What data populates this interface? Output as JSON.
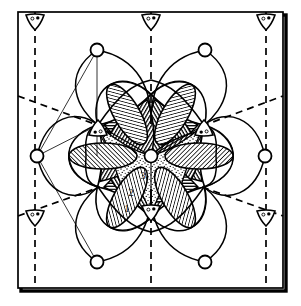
{
  "figure": {
    "name": "crystallographic-unit-cell-diagram",
    "type": "diagram",
    "background_color": "#ffffff",
    "ink_color": "#000000",
    "border": {
      "style": "solid-square-with-drop-shadow",
      "x": 18,
      "y": 12,
      "width": 265,
      "height": 276,
      "stroke_width": 1.6,
      "shadow_offset": 3
    }
  },
  "labels": [
    {
      "id": "zone-3",
      "text": "3",
      "x": 143,
      "y": 175
    },
    {
      "id": "zone-2",
      "text": "2",
      "x": 131,
      "y": 192
    },
    {
      "id": "zone-1",
      "text": "1",
      "x": 127,
      "y": 209
    }
  ],
  "symmetry": {
    "center_point": {
      "x": 151,
      "y": 156,
      "radius": 6.5,
      "symbol": "six-fold-axis-open-circle"
    },
    "triad_axes": [
      {
        "x": 151,
        "y": 217,
        "rotation": 0,
        "symbol": "three-fold-axis-triangle"
      },
      {
        "x": 98,
        "y": 125,
        "rotation": 180,
        "symbol": "three-fold-axis-triangle"
      },
      {
        "x": 204,
        "y": 125,
        "rotation": 180,
        "symbol": "three-fold-axis-triangle"
      }
    ],
    "corner_triads": [
      {
        "x": 35,
        "y": 18,
        "symbol": "three-fold-axis-triangle"
      },
      {
        "x": 151,
        "y": 18,
        "symbol": "three-fold-axis-triangle"
      },
      {
        "x": 266,
        "y": 18,
        "symbol": "three-fold-axis-triangle"
      },
      {
        "x": 35,
        "y": 216,
        "symbol": "three-fold-axis-triangle"
      },
      {
        "x": 266,
        "y": 216,
        "symbol": "three-fold-axis-triangle"
      }
    ],
    "open_circle_nodes": [
      {
        "x": 97,
        "y": 50
      },
      {
        "x": 205,
        "y": 50
      },
      {
        "x": 37,
        "y": 156
      },
      {
        "x": 265,
        "y": 156
      },
      {
        "x": 97,
        "y": 262
      },
      {
        "x": 205,
        "y": 262
      }
    ],
    "node_radius": 6.5
  },
  "dashed_lines": {
    "style": "dashed",
    "dash_pattern": "7,5",
    "vertical": [
      {
        "x": 35,
        "y1": 18,
        "y2": 288
      },
      {
        "x": 151,
        "y1": 18,
        "y2": 288
      },
      {
        "x": 266,
        "y1": 18,
        "y2": 288
      }
    ],
    "diagonal": [
      {
        "x1": 18,
        "y1": 95,
        "x2": 98,
        "y2": 125
      },
      {
        "x1": 204,
        "y1": 125,
        "x2": 283,
        "y2": 95
      },
      {
        "x1": 18,
        "y1": 216,
        "x2": 98,
        "y2": 188
      },
      {
        "x1": 204,
        "y1": 188,
        "x2": 283,
        "y2": 216
      }
    ]
  },
  "fills": {
    "central_star": "stipple",
    "inner_lobes": "horizontal-hatch",
    "outer_lenses": "diagonal-hatch",
    "petals": "none-white"
  },
  "geometry": {
    "hexagon_vertices": [
      {
        "x": 98,
        "y": 125
      },
      {
        "x": 204,
        "y": 125
      },
      {
        "x": 151,
        "y": 217
      }
    ],
    "petal_count": 6,
    "lens_count": 6
  }
}
